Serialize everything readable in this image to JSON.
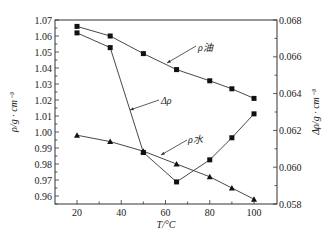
{
  "chart_data": {
    "type": "line",
    "title": "",
    "xlabel": "T/°C",
    "ylabel_left": "ρ/g · cm⁻³",
    "ylabel_right": "Δρ/g · cm⁻³",
    "xlim": [
      10,
      110
    ],
    "ylim_left": [
      0.955,
      1.07
    ],
    "ylim_right": [
      0.058,
      0.068
    ],
    "x_ticks": [
      20,
      40,
      60,
      80,
      100
    ],
    "y_left_ticks": [
      "1.07",
      "1.06",
      "1.05",
      "1.04",
      "1.03",
      "1.02",
      "1.01",
      "1.00",
      "0.99",
      "0.98",
      "0.97",
      "0.96"
    ],
    "y_right_ticks": [
      "0.068",
      "0.066",
      "0.064",
      "0.062",
      "0.060",
      "0.058"
    ],
    "grid": false,
    "legend": "inline annotations",
    "x": [
      20,
      35,
      50,
      65,
      80,
      90,
      100
    ],
    "series": [
      {
        "name": "ρ油",
        "axis": "left",
        "marker": "square",
        "values": [
          1.066,
          1.06,
          1.049,
          1.039,
          1.032,
          1.027,
          1.021
        ]
      },
      {
        "name": "ρ水",
        "axis": "left",
        "marker": "triangle",
        "values": [
          0.998,
          0.994,
          0.988,
          0.98,
          0.972,
          0.965,
          0.958
        ]
      },
      {
        "name": "Δρ",
        "axis": "right",
        "marker": "square",
        "values": [
          0.0673,
          0.0665,
          0.0608,
          0.0592,
          0.0604,
          0.0616,
          0.0629
        ]
      }
    ],
    "annotations": [
      {
        "text": "ρ油",
        "series": "ρ油"
      },
      {
        "text": "Δρ",
        "series": "Δρ"
      },
      {
        "text": "ρ水",
        "series": "ρ水"
      }
    ]
  }
}
